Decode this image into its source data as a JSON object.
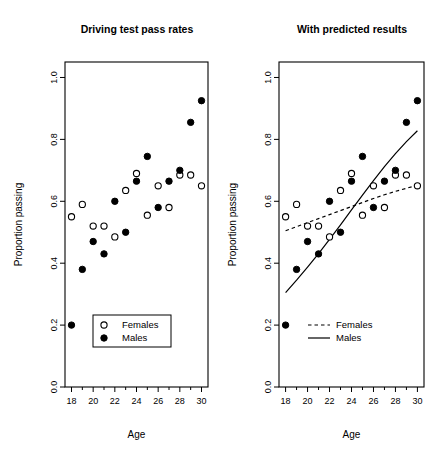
{
  "figure": {
    "width": 443,
    "height": 460,
    "background": "#ffffff",
    "foreground": "#000000"
  },
  "chart_data": [
    {
      "type": "scatter",
      "panel_id": "left",
      "title": "Driving test pass rates",
      "xlabel": "Age",
      "ylabel": "Proportion passing",
      "xlim": [
        17.4,
        30.6
      ],
      "ylim": [
        0.0,
        1.05
      ],
      "xticks": [
        18,
        20,
        22,
        24,
        26,
        28,
        30
      ],
      "xtick_labels": [
        "18",
        "20",
        "22",
        "24",
        "26",
        "28",
        "30"
      ],
      "xminorticks": [
        19,
        21,
        23,
        25,
        27,
        29
      ],
      "yticks": [
        0.0,
        0.2,
        0.4,
        0.6,
        0.8,
        1.0
      ],
      "ytick_labels": [
        "0.0",
        "0.2",
        "0.4",
        "0.6",
        "0.8",
        "1.0"
      ],
      "grid": false,
      "x": [
        18,
        19,
        20,
        21,
        22,
        23,
        24,
        25,
        26,
        27,
        28,
        29,
        30
      ],
      "series": [
        {
          "name": "Females",
          "marker": "open-circle",
          "values": [
            0.55,
            0.59,
            0.52,
            0.52,
            0.485,
            0.635,
            0.69,
            0.555,
            0.65,
            0.58,
            0.685,
            0.685,
            0.65
          ]
        },
        {
          "name": "Males",
          "marker": "filled-circle",
          "values": [
            0.2,
            0.38,
            0.47,
            0.43,
            0.6,
            0.5,
            0.665,
            0.745,
            0.58,
            0.665,
            0.7,
            0.855,
            0.925
          ]
        }
      ],
      "legend": {
        "position": "bottom-left-inside",
        "boxed": true,
        "entries": [
          {
            "label": "Females",
            "marker": "open-circle"
          },
          {
            "label": "Males",
            "marker": "filled-circle"
          }
        ]
      }
    },
    {
      "type": "scatter",
      "panel_id": "right",
      "title": "With predicted results",
      "xlabel": "Age",
      "ylabel": "Proportion passing",
      "xlim": [
        17.4,
        30.6
      ],
      "ylim": [
        0.0,
        1.05
      ],
      "xticks": [
        18,
        20,
        22,
        24,
        26,
        28,
        30
      ],
      "xtick_labels": [
        "18",
        "20",
        "22",
        "24",
        "26",
        "28",
        "30"
      ],
      "xminorticks": [
        19,
        21,
        23,
        25,
        27,
        29
      ],
      "yticks": [
        0.0,
        0.2,
        0.4,
        0.6,
        0.8,
        1.0
      ],
      "ytick_labels": [
        "0.0",
        "0.2",
        "0.4",
        "0.6",
        "0.8",
        "1.0"
      ],
      "grid": false,
      "x": [
        18,
        19,
        20,
        21,
        22,
        23,
        24,
        25,
        26,
        27,
        28,
        29,
        30
      ],
      "series": [
        {
          "name": "Females",
          "marker": "open-circle",
          "values": [
            0.55,
            0.59,
            0.52,
            0.52,
            0.485,
            0.635,
            0.69,
            0.555,
            0.65,
            0.58,
            0.685,
            0.685,
            0.65
          ]
        },
        {
          "name": "Males",
          "marker": "filled-circle",
          "values": [
            0.2,
            0.38,
            0.47,
            0.43,
            0.6,
            0.5,
            0.665,
            0.745,
            0.58,
            0.665,
            0.7,
            0.855,
            0.925
          ]
        }
      ],
      "fits": [
        {
          "name": "Females",
          "line_style": "dashed",
          "x": [
            18,
            19,
            20,
            21,
            22,
            23,
            24,
            25,
            26,
            27,
            28,
            29,
            30
          ],
          "values": [
            0.505,
            0.518,
            0.531,
            0.544,
            0.557,
            0.57,
            0.583,
            0.596,
            0.609,
            0.621,
            0.632,
            0.642,
            0.652
          ]
        },
        {
          "name": "Males",
          "line_style": "solid",
          "x": [
            18,
            19,
            20,
            21,
            22,
            23,
            24,
            25,
            26,
            27,
            28,
            29,
            30
          ],
          "values": [
            0.305,
            0.345,
            0.387,
            0.431,
            0.477,
            0.524,
            0.572,
            0.62,
            0.667,
            0.712,
            0.754,
            0.793,
            0.828
          ]
        }
      ],
      "legend": {
        "position": "bottom-left-inside",
        "boxed": false,
        "entries": [
          {
            "label": "Females",
            "marker": "dashed-line"
          },
          {
            "label": "Males",
            "marker": "solid-line"
          }
        ]
      }
    }
  ]
}
